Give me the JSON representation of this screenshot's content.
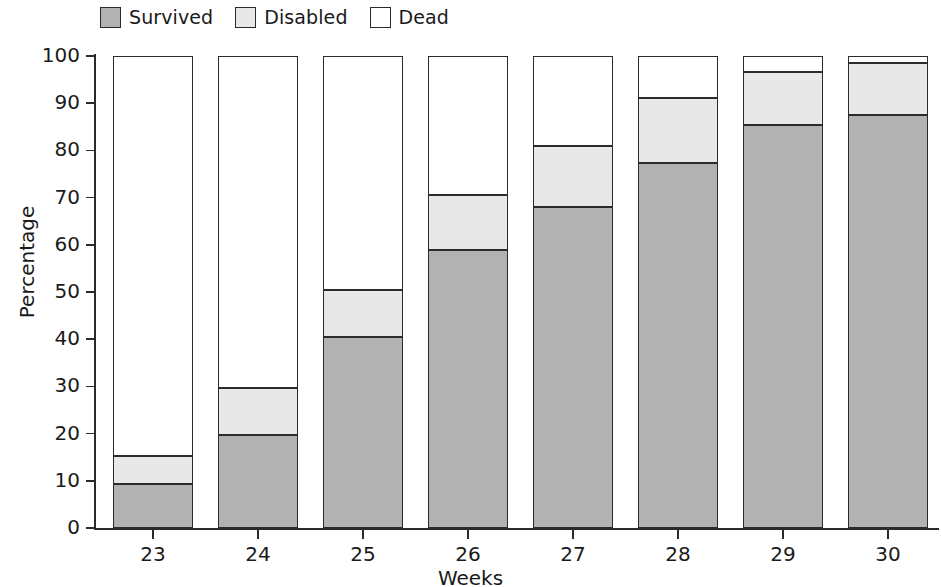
{
  "legend": {
    "items": [
      {
        "label": "Survived",
        "key": "survived",
        "color": "#b2b2b2"
      },
      {
        "label": "Disabled",
        "key": "disabled",
        "color": "#e8e8e8"
      },
      {
        "label": "Dead",
        "key": "dead",
        "color": "#ffffff"
      }
    ]
  },
  "axes": {
    "ylabel": "Percentage",
    "xlabel": "Weeks",
    "yticks": [
      "0",
      "10",
      "20",
      "30",
      "40",
      "50",
      "60",
      "70",
      "80",
      "90",
      "100"
    ],
    "xticks": [
      "23",
      "24",
      "25",
      "26",
      "27",
      "28",
      "29",
      "30"
    ]
  },
  "chart_data": {
    "type": "bar",
    "title": "",
    "subtitle": "",
    "xlabel": "Weeks",
    "ylabel": "Percentage",
    "ylim": [
      0,
      100
    ],
    "yticks": [
      0,
      10,
      20,
      30,
      40,
      50,
      60,
      70,
      80,
      90,
      100
    ],
    "grid": false,
    "stacked": true,
    "legend_position": "top-left",
    "categories": [
      "23",
      "24",
      "25",
      "26",
      "27",
      "28",
      "29",
      "30"
    ],
    "series": [
      {
        "name": "Survived",
        "color": "#b2b2b2",
        "values": [
          9.3,
          19.7,
          40.5,
          58.9,
          68.0,
          77.3,
          85.4,
          87.5
        ]
      },
      {
        "name": "Disabled",
        "color": "#e8e8e8",
        "values": [
          6.0,
          10.0,
          9.9,
          11.6,
          13.0,
          13.8,
          11.2,
          11.0
        ]
      },
      {
        "name": "Dead",
        "color": "#ffffff",
        "values": [
          84.7,
          70.3,
          49.6,
          29.5,
          19.0,
          8.9,
          3.4,
          1.5
        ]
      }
    ],
    "cumulative_tops": {
      "survived": [
        9.3,
        19.7,
        40.5,
        58.9,
        68.0,
        77.3,
        85.4,
        87.5
      ],
      "disabled": [
        15.3,
        29.7,
        50.4,
        70.5,
        81.0,
        91.1,
        96.6,
        98.5
      ],
      "dead": [
        100,
        100,
        100,
        100,
        100,
        100,
        100,
        100
      ]
    }
  }
}
